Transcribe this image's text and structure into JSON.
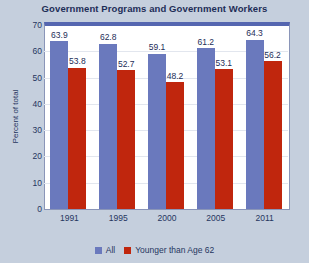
{
  "chart_data": {
    "type": "bar",
    "title": "Government Programs and Government Workers",
    "xlabel": "",
    "ylabel": "Percent of total",
    "categories": [
      "1991",
      "1995",
      "2000",
      "2005",
      "2011"
    ],
    "ylim": [
      0,
      70
    ],
    "yticks": [
      0,
      10,
      20,
      30,
      40,
      50,
      60,
      70
    ],
    "grid": true,
    "legend_position": "bottom",
    "series": [
      {
        "name": "All",
        "color": "#6a79bd",
        "values": [
          63.9,
          62.8,
          59.1,
          61.2,
          64.3
        ],
        "labels": [
          "63.9",
          "62.8",
          "59.1",
          "61.2",
          "64.3"
        ]
      },
      {
        "name": "Younger than Age 62",
        "color": "#c0260d",
        "values": [
          53.8,
          52.7,
          48.2,
          53.1,
          56.2
        ],
        "labels": [
          "53.8",
          "52.7",
          "48.2",
          "53.1",
          "56.2"
        ]
      }
    ]
  },
  "colors": {
    "background": "#c5cfdd",
    "plot_background": "#ffffff",
    "title_text": "#1d2f57",
    "axis_text": "#25365f",
    "plot_border": "#8a95b8",
    "plot_top_border": "#5566b0",
    "gridline": "#e2e6ee"
  }
}
